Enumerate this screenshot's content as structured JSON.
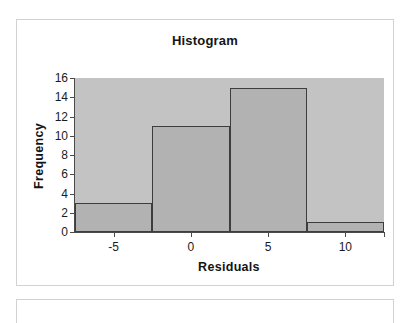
{
  "card": {
    "title": "Histogram"
  },
  "axes": {
    "y_title": "Frequency",
    "x_title": "Residuals",
    "y_ticks": [
      "0",
      "2",
      "4",
      "6",
      "8",
      "10",
      "12",
      "14",
      "16"
    ],
    "x_ticks": [
      "-5",
      "0",
      "5",
      "10"
    ]
  },
  "colors": {
    "plot_background": "#c3c3c3",
    "bar_fill": "#b2b2b2",
    "bar_outline": "#3d3d3d",
    "axis": "#4a4a4a",
    "card_border": "#d2d2d2",
    "text": "#151515",
    "page_background": "#ffffff"
  },
  "chart_data": {
    "type": "bar",
    "title": "Histogram",
    "xlabel": "Residuals",
    "ylabel": "Frequency",
    "categories": [
      "-7.5 to -2.5",
      "-2.5 to 2.5",
      "2.5 to 7.5",
      "7.5 to 12.5"
    ],
    "bin_edges": [
      -7.5,
      -2.5,
      2.5,
      7.5,
      12.5
    ],
    "bin_centers": [
      -5,
      0,
      5,
      10
    ],
    "values": [
      3,
      11,
      15,
      1
    ],
    "xlim": [
      -7.5,
      12.5
    ],
    "ylim": [
      0,
      16
    ],
    "y_tick_values": [
      0,
      2,
      4,
      6,
      8,
      10,
      12,
      14,
      16
    ],
    "x_tick_values": [
      -5,
      0,
      5,
      10
    ],
    "grid": false,
    "legend": false,
    "legend_position": "none"
  }
}
